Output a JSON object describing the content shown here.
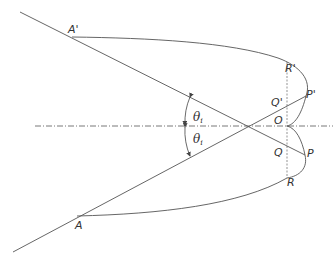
{
  "diagram": {
    "colors": {
      "stroke": "#555555",
      "text": "#333333",
      "background": "#ffffff"
    },
    "points": {
      "A_prime": {
        "label": "A'",
        "x": 72,
        "y": 37
      },
      "A": {
        "label": "A",
        "x": 77,
        "y": 216
      },
      "R_prime": {
        "label": "R'",
        "x": 287,
        "y": 62
      },
      "Q_prime": {
        "label": "Q'",
        "x": 287,
        "y": 106
      },
      "P_prime": {
        "label": "P'",
        "x": 306,
        "y": 96
      },
      "O": {
        "label": "O",
        "x": 287,
        "y": 126
      },
      "Q": {
        "label": "Q",
        "x": 287,
        "y": 146
      },
      "P": {
        "label": "P",
        "x": 305,
        "y": 155
      },
      "R": {
        "label": "R",
        "x": 287,
        "y": 176
      },
      "crossing": {
        "x": 248,
        "y": 126
      }
    },
    "angles": {
      "upper": {
        "symbol": "θ",
        "subscript": "i"
      },
      "lower": {
        "symbol": "θ",
        "subscript": "i"
      }
    }
  }
}
